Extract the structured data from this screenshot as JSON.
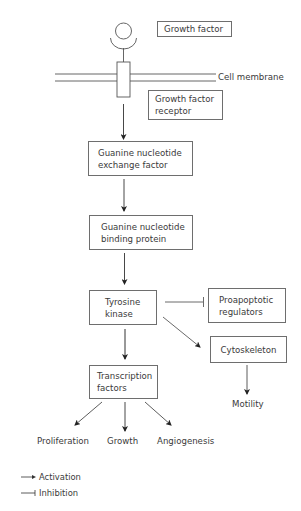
{
  "diagram": {
    "type": "signaling-pathway",
    "nodes": {
      "growth_factor": "Growth factor",
      "cell_membrane": "Cell membrane",
      "receptor_line1": "Growth factor",
      "receptor_line2": "receptor",
      "gef_line1": "Guanine nucleotide",
      "gef_line2": "exchange factor",
      "gbp_line1": "Guanine nucleotide",
      "gbp_line2": "binding protein",
      "tk_line1": "Tyrosine",
      "tk_line2": "kinase",
      "proapoptotic_line1": "Proapoptotic",
      "proapoptotic_line2": "regulators",
      "cytoskeleton": "Cytoskeleton",
      "motility": "Motility",
      "tf_line1": "Transcription",
      "tf_line2": "factors",
      "proliferation": "Proliferation",
      "growth": "Growth",
      "angiogenesis": "Angiogenesis"
    },
    "edges": [
      {
        "from": "Growth factor receptor",
        "to": "Guanine nucleotide exchange factor",
        "type": "activation"
      },
      {
        "from": "Guanine nucleotide exchange factor",
        "to": "Guanine nucleotide binding protein",
        "type": "activation"
      },
      {
        "from": "Guanine nucleotide binding protein",
        "to": "Tyrosine kinase",
        "type": "activation"
      },
      {
        "from": "Tyrosine kinase",
        "to": "Proapoptotic regulators",
        "type": "inhibition"
      },
      {
        "from": "Tyrosine kinase",
        "to": "Cytoskeleton",
        "type": "activation"
      },
      {
        "from": "Tyrosine kinase",
        "to": "Transcription factors",
        "type": "activation"
      },
      {
        "from": "Cytoskeleton",
        "to": "Motility",
        "type": "activation"
      },
      {
        "from": "Transcription factors",
        "to": "Proliferation",
        "type": "activation"
      },
      {
        "from": "Transcription factors",
        "to": "Growth",
        "type": "activation"
      },
      {
        "from": "Transcription factors",
        "to": "Angiogenesis",
        "type": "activation"
      }
    ],
    "legend": {
      "activation": "Activation",
      "inhibition": "Inhibition"
    },
    "colors": {
      "line": "#333333",
      "box_border": "#6e6e6e",
      "text": "#3a3a3a",
      "background": "#ffffff"
    }
  }
}
